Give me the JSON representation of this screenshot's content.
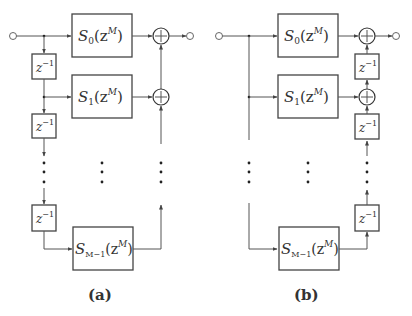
{
  "figure": {
    "panels": [
      {
        "id": "a",
        "caption": "(a)",
        "structure": "tapped delay line on input, adders chained on output",
        "filters": [
          {
            "name": "S",
            "sub": "0",
            "arg": "(z",
            "sup": "M",
            "close": ")"
          },
          {
            "name": "S",
            "sub": "1",
            "arg": "(z",
            "sup": "M",
            "close": ")"
          },
          {
            "name": "S",
            "sub": "M−1",
            "arg": "(z",
            "sup": "M",
            "close": ")"
          }
        ],
        "delays": [
          {
            "base": "z",
            "exp": "−1"
          },
          {
            "base": "z",
            "exp": "−1"
          },
          {
            "base": "z",
            "exp": "−1"
          }
        ],
        "adder_symbol": "+"
      },
      {
        "id": "b",
        "caption": "(b)",
        "structure": "shared input, delays chained between output adders",
        "filters": [
          {
            "name": "S",
            "sub": "0",
            "arg": "(z",
            "sup": "M",
            "close": ")"
          },
          {
            "name": "S",
            "sub": "1",
            "arg": "(z",
            "sup": "M",
            "close": ")"
          },
          {
            "name": "S",
            "sub": "M−1",
            "arg": "(z",
            "sup": "M",
            "close": ")"
          }
        ],
        "delays": [
          {
            "base": "z",
            "exp": "−1"
          },
          {
            "base": "z",
            "exp": "−1"
          },
          {
            "base": "z",
            "exp": "−1"
          }
        ],
        "adder_symbol": "+"
      }
    ]
  }
}
